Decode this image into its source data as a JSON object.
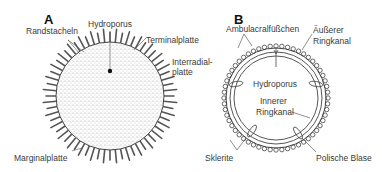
{
  "panel_a": {
    "letter": "A",
    "labels": {
      "randstacheln": "Randstacheln",
      "hydroporus": "Hydroporus",
      "terminalplatte": "Terminalplatte",
      "interradial_line1": "Interradial-",
      "interradial_line2": "platte",
      "marginalplatte": "Marginalplatte"
    }
  },
  "panel_b": {
    "letter": "B",
    "labels": {
      "ambulacral": "Ambulacralfüßchen",
      "aeusserer_line1": "Äußerer",
      "aeusserer_line2": "Ringkanal",
      "hydroporus": "Hydroporus",
      "innerer_line1": "Innerer",
      "innerer_line2": "Ringkanal",
      "sklerite": "Sklerite",
      "polische_blase": "Polische Blase"
    }
  },
  "colors": {
    "line": "#444444",
    "stipple": "#8a8a8a",
    "text": "#3a3a3a"
  }
}
